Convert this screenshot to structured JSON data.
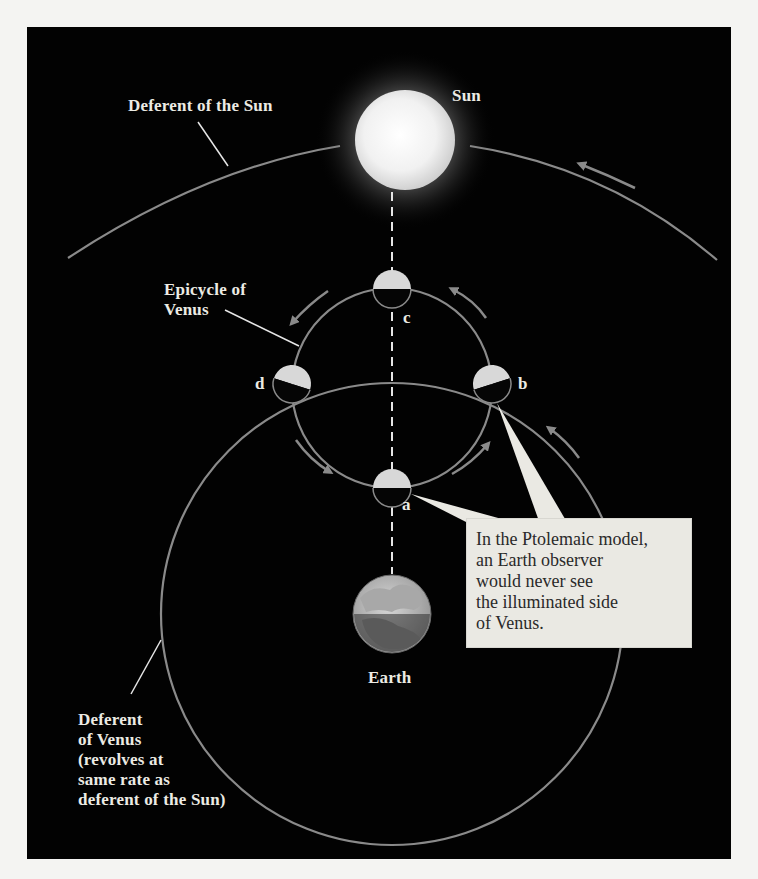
{
  "figure": {
    "background_color": "#020202",
    "page_color": "#f4f4f2",
    "orbit_color": "#8a8a8a",
    "label_color": "#ecebe4"
  },
  "bodies": {
    "sun": {
      "label": "Sun"
    },
    "earth": {
      "label": "Earth"
    }
  },
  "labels": {
    "deferent_sun": "Deferent of the Sun",
    "epicycle_venus": "Epicycle of\nVenus",
    "deferent_venus": "Deferent\nof Venus\n(revolves at\nsame rate as\ndeferent of the Sun)"
  },
  "venus_positions": [
    {
      "id": "a",
      "label": "a"
    },
    {
      "id": "b",
      "label": "b"
    },
    {
      "id": "c",
      "label": "c"
    },
    {
      "id": "d",
      "label": "d"
    }
  ],
  "callout": {
    "text": "In the Ptolemaic model,\nan Earth observer\nwould never see\nthe illuminated side\nof Venus."
  }
}
